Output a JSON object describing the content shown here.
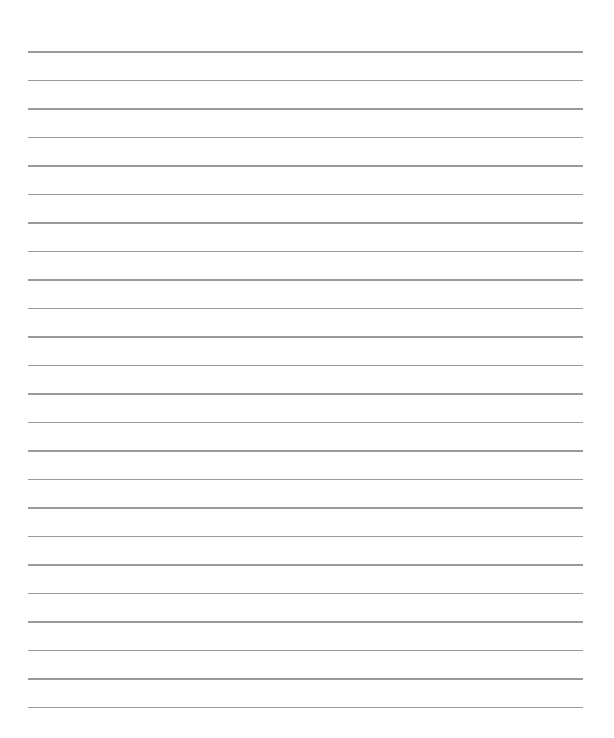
{
  "page": {
    "type": "lined-paper",
    "background": "#ffffff",
    "line_color": "#9a9a9a",
    "line_count": 24,
    "first_line_y": 51,
    "line_spacing": 28.5,
    "line_left": 28,
    "line_right": 583
  }
}
